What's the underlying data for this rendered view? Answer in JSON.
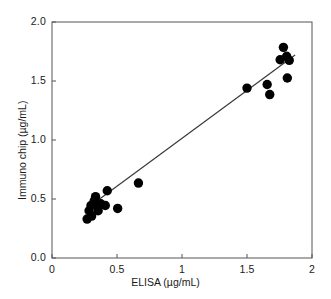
{
  "chart_data": {
    "type": "scatter",
    "title": "",
    "xlabel": "ELISA (µg/mL)",
    "ylabel": "Immuno chip  (µg/mL)",
    "xlim": [
      0,
      2
    ],
    "ylim": [
      0,
      2
    ],
    "xticks": [
      "0",
      "0.5",
      "1",
      "1.5",
      "2"
    ],
    "xtick_values": [
      0,
      0.5,
      1,
      1.5,
      2
    ],
    "yticks": [
      "0.0",
      "0.5",
      "1.0",
      "1.5",
      "2.0"
    ],
    "ytick_values": [
      0,
      0.5,
      1.0,
      1.5,
      2.0
    ],
    "grid": false,
    "legend": "none",
    "marker": {
      "shape": "circle",
      "color": "#000000",
      "size": 7
    },
    "points": [
      {
        "x": 0.27,
        "y": 0.33
      },
      {
        "x": 0.285,
        "y": 0.4
      },
      {
        "x": 0.3,
        "y": 0.445
      },
      {
        "x": 0.305,
        "y": 0.355
      },
      {
        "x": 0.325,
        "y": 0.485
      },
      {
        "x": 0.335,
        "y": 0.52
      },
      {
        "x": 0.345,
        "y": 0.445
      },
      {
        "x": 0.355,
        "y": 0.4
      },
      {
        "x": 0.375,
        "y": 0.46
      },
      {
        "x": 0.41,
        "y": 0.445
      },
      {
        "x": 0.425,
        "y": 0.57
      },
      {
        "x": 0.505,
        "y": 0.42
      },
      {
        "x": 0.665,
        "y": 0.635
      },
      {
        "x": 1.5,
        "y": 1.44
      },
      {
        "x": 1.655,
        "y": 1.47
      },
      {
        "x": 1.675,
        "y": 1.385
      },
      {
        "x": 1.755,
        "y": 1.68
      },
      {
        "x": 1.78,
        "y": 1.785
      },
      {
        "x": 1.805,
        "y": 1.71
      },
      {
        "x": 1.81,
        "y": 1.525
      },
      {
        "x": 1.825,
        "y": 1.675
      }
    ],
    "fit_line": {
      "type": "linear-regression",
      "x_start": 0.275,
      "y_start": 0.425,
      "x_end": 1.87,
      "y_end": 1.72
    },
    "colors": {
      "marker": "#000000",
      "line": "#3a3a3a",
      "axis": "#555555",
      "text": "#1a1a1a",
      "background": "#ffffff"
    }
  },
  "axes": {
    "x_tick_labels": [
      "0",
      "0.5",
      "1",
      "1.5",
      "2"
    ],
    "y_tick_labels": [
      "0.0",
      "0.5",
      "1.0",
      "1.5",
      "2.0"
    ],
    "x_title": "ELISA (µg/mL)",
    "y_title": "Immuno chip  (µg/mL)"
  }
}
